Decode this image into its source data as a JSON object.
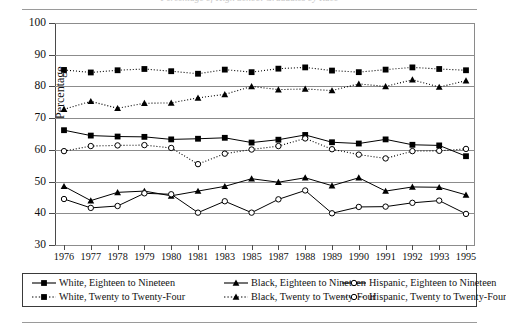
{
  "figure": {
    "title_faint": "Percentage of High School Graduates by Race",
    "y_axis_title": "Percentage"
  },
  "legend": {
    "rows": [
      [
        {
          "label": "White, Eighteen to Nineteen",
          "marker": "filled-square",
          "line": "solid",
          "icon": "legend-marker-filled-square"
        },
        {
          "label": "Black, Eighteen to Nineteen",
          "marker": "filled-triangle",
          "line": "solid",
          "icon": "legend-marker-filled-triangle"
        },
        {
          "label": "Hispanic, Eighteen to Nineteen",
          "marker": "open-circle",
          "line": "solid",
          "icon": "legend-marker-open-circle"
        }
      ],
      [
        {
          "label": "White, Twenty to Twenty-Four",
          "marker": "filled-square",
          "line": "dotted",
          "icon": "legend-marker-filled-square"
        },
        {
          "label": "Black, Twenty to Twenty-Four",
          "marker": "filled-triangle",
          "line": "dotted",
          "icon": "legend-marker-filled-triangle"
        },
        {
          "label": "Hispanic, Twenty to Twenty-Four",
          "marker": "open-circle",
          "line": "dotted",
          "icon": "legend-marker-open-circle"
        }
      ]
    ]
  },
  "chart_data": {
    "type": "line",
    "title": "",
    "xlabel": "",
    "ylabel": "Percentage",
    "ylim": [
      30,
      100
    ],
    "yticks": [
      30,
      40,
      50,
      60,
      70,
      80,
      90,
      100
    ],
    "grid": true,
    "legend_position": "bottom",
    "categories": [
      "1976",
      "1977",
      "1978",
      "1979",
      "1980",
      "1981",
      "1983",
      "1985",
      "1987",
      "1988",
      "1989",
      "1990",
      "1991",
      "1992",
      "1993",
      "1995"
    ],
    "series": [
      {
        "name": "White, Eighteen to Nineteen",
        "marker": "filled-square",
        "line": "solid",
        "color": "#000000",
        "values": [
          66.2,
          64.5,
          64.2,
          64.1,
          63.3,
          63.5,
          63.8,
          62.3,
          63.2,
          64.7,
          62.4,
          62.0,
          63.3,
          61.6,
          61.4,
          58.0
        ]
      },
      {
        "name": "White, Twenty to Twenty-Four",
        "marker": "filled-square",
        "line": "dotted",
        "color": "#000000",
        "values": [
          85.2,
          84.4,
          85.1,
          85.5,
          84.8,
          84.0,
          85.3,
          84.5,
          85.6,
          86.0,
          85.0,
          84.5,
          85.3,
          86.0,
          85.5,
          85.1
        ]
      },
      {
        "name": "Black, Eighteen to Nineteen",
        "marker": "filled-triangle",
        "line": "solid",
        "color": "#000000",
        "values": [
          48.5,
          44.0,
          46.6,
          47.0,
          45.5,
          47.0,
          48.5,
          50.9,
          49.8,
          51.2,
          48.7,
          51.2,
          47.0,
          48.3,
          48.2,
          45.8
        ]
      },
      {
        "name": "Black, Twenty to Twenty-Four",
        "marker": "filled-triangle",
        "line": "dotted",
        "color": "#000000",
        "values": [
          72.8,
          75.3,
          73.1,
          74.7,
          74.8,
          76.4,
          77.5,
          80.0,
          79.0,
          79.2,
          78.7,
          80.8,
          80.0,
          82.1,
          79.8,
          81.8
        ]
      },
      {
        "name": "Hispanic, Eighteen to Nineteen",
        "marker": "open-circle",
        "line": "solid",
        "color": "#000000",
        "values": [
          44.5,
          41.7,
          42.3,
          46.3,
          46.0,
          40.2,
          43.8,
          40.2,
          44.4,
          47.2,
          40.0,
          42.0,
          42.1,
          43.3,
          44.0,
          39.8
        ]
      },
      {
        "name": "Hispanic, Twenty to Twenty-Four",
        "marker": "open-circle",
        "line": "dotted",
        "color": "#000000",
        "values": [
          59.6,
          61.2,
          61.4,
          61.5,
          60.6,
          55.5,
          58.8,
          60.1,
          61.2,
          63.6,
          60.2,
          58.5,
          57.3,
          59.6,
          59.7,
          60.3
        ]
      }
    ]
  }
}
